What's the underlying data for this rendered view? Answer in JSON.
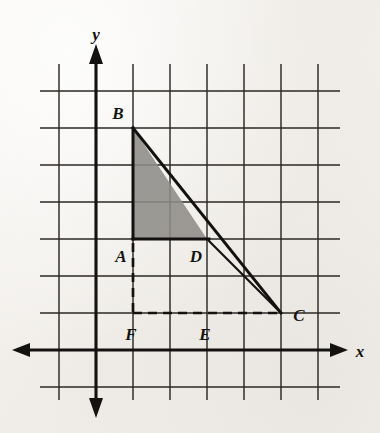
{
  "figure": {
    "axes": {
      "x_label": "x",
      "y_label": "y",
      "x_axis_name": "horizontal-axis",
      "y_axis_name": "vertical-axis",
      "x_arrow_left": "arrow-left-icon",
      "x_arrow_right": "arrow-right-icon",
      "y_arrow_up": "arrow-up-icon",
      "y_arrow_down": "arrow-down-icon"
    },
    "grid": {
      "spacing_px": 37,
      "origin_px": [
        96,
        350
      ],
      "vertical_lines_px": [
        59,
        96,
        133,
        170,
        207,
        244,
        281,
        318
      ],
      "horizontal_lines_px": [
        91,
        128,
        165,
        202,
        239,
        276,
        313,
        350,
        387
      ],
      "columns": 8,
      "rows": 9
    },
    "points": [
      {
        "label": "B",
        "name": "point-b",
        "px": [
          133,
          128
        ],
        "grid": [
          1,
          6
        ],
        "label_px": [
          118,
          119
        ]
      },
      {
        "label": "A",
        "name": "point-a",
        "px": [
          133,
          239
        ],
        "grid": [
          1,
          3
        ],
        "label_px": [
          118,
          259
        ]
      },
      {
        "label": "D",
        "name": "point-d",
        "px": [
          207,
          239
        ],
        "grid": [
          3,
          3
        ],
        "label_px": [
          194,
          259
        ]
      },
      {
        "label": "C",
        "name": "point-c",
        "px": [
          281,
          313
        ],
        "grid": [
          5,
          1
        ],
        "label_px": [
          296,
          321
        ]
      },
      {
        "label": "F",
        "name": "point-f",
        "px": [
          133,
          313
        ],
        "grid": [
          1,
          1
        ],
        "label_px": [
          126,
          338
        ]
      },
      {
        "label": "E",
        "name": "point-e",
        "px": [
          207,
          313
        ],
        "grid": [
          3,
          1
        ],
        "label_px": [
          200,
          338
        ]
      }
    ],
    "segments": [
      {
        "name": "segment-bc-hypotenuse",
        "from": "B",
        "to": "C",
        "style": "solid"
      },
      {
        "name": "segment-ba-vertical",
        "from": "B",
        "to": "A",
        "style": "solid"
      },
      {
        "name": "segment-ad-horizontal",
        "from": "A",
        "to": "D",
        "style": "solid"
      },
      {
        "name": "segment-dc-thin",
        "from": "D",
        "to": "C",
        "style": "solid-thin"
      },
      {
        "name": "segment-af-dashed",
        "from": "A",
        "to": "F",
        "style": "dashed"
      },
      {
        "name": "segment-fc-dashed",
        "from": "F",
        "to": "C",
        "style": "dashed"
      }
    ],
    "shaded_regions": [
      {
        "name": "shaded-triangle-abd",
        "vertices": [
          "B",
          "A",
          "D"
        ]
      },
      {
        "name": "shaded-sliver-dc",
        "vertices": [
          "D",
          "C",
          "BC-at-D-x"
        ]
      }
    ],
    "colors": {
      "ink": "#131110",
      "grid": "#2b2824",
      "shade": "#8e8c88",
      "paper": "#f3f1ee"
    }
  }
}
